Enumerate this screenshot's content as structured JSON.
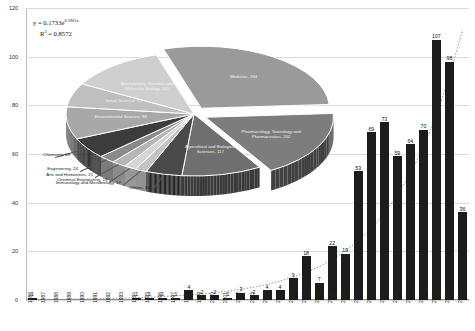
{
  "chart_data": {
    "type": "bar",
    "title": "",
    "xlabel": "",
    "ylabel": "",
    "ylim": [
      0,
      120
    ],
    "ytick_labels": [
      "0",
      "20",
      "40",
      "60",
      "80",
      "100",
      "120"
    ],
    "ytick_values": [
      0,
      20,
      40,
      60,
      80,
      100,
      120
    ],
    "grid": true,
    "legend": "none",
    "categories": [
      "1986",
      "1987",
      "1988",
      "1989",
      "1990",
      "1991",
      "1992",
      "1993",
      "1994",
      "1995",
      "1996",
      "1997",
      "1998",
      "1999",
      "2000",
      "2001",
      "2002",
      "2003",
      "2004",
      "2005",
      "2006",
      "2007",
      "2008",
      "2009",
      "2010",
      "2011",
      "2012",
      "2013",
      "2014",
      "2015",
      "2016",
      "2017",
      "2018",
      "2019"
    ],
    "values": [
      1,
      0,
      0,
      0,
      0,
      0,
      0,
      0,
      1,
      1,
      1,
      1,
      4,
      2,
      2,
      1,
      3,
      2,
      4,
      4,
      9,
      18,
      7,
      22,
      19,
      53,
      69,
      73,
      59,
      64,
      70,
      107,
      98,
      36
    ],
    "bar_labels": [
      "1",
      "",
      "",
      "",
      "",
      "",
      "",
      "",
      "1",
      "1",
      "1",
      "1",
      "4",
      "2",
      "2",
      "1",
      "3",
      "2",
      "4",
      "4",
      "9",
      "18",
      "7",
      "22",
      "19",
      "53",
      "69",
      "73",
      "59",
      "64",
      "70",
      "107",
      "98",
      "36"
    ],
    "bar_color": "#1c1c1c",
    "annotations": {
      "equation": "y = 0.1733e",
      "equation_exponent": "0.1901x",
      "r_squared_label": "R",
      "r_squared_sup": "2",
      "r_squared_value": " = 0.8572"
    },
    "trendline": {
      "type": "exponential",
      "equation": "y = 0.1733e^(0.1901x)",
      "r_squared": 0.8572,
      "style": "dotted"
    }
  },
  "pie_data": {
    "type": "pie",
    "style": "3d-exploded",
    "title": "",
    "slices": [
      {
        "label": "Medicine",
        "value": 334,
        "color": "#9a9a9a",
        "text": "Medicine, 334"
      },
      {
        "label": "Pharmacology, Toxicology and Pharmaceutics",
        "value": 202,
        "color": "#7d7d7d",
        "text": "Pharmacology, Toxicology and Pharmaceutics, 202"
      },
      {
        "label": "Agricultural and Biological Sciences",
        "value": 117,
        "color": "#6f6f6f",
        "text": "Agricultural and Biological Sciences, 117"
      },
      {
        "label": "Others",
        "value": 53,
        "color": "#4a4a4a",
        "text": "Others, 53"
      },
      {
        "label": "Immunology and Microbiology",
        "value": 17,
        "color": "#c4c4c4",
        "text": "Immunology and Microbiology, 17"
      },
      {
        "label": "Chemical Engineering",
        "value": 18,
        "color": "#d6d6d6",
        "text": "Chemical Engineering, 18"
      },
      {
        "label": "Arts and Humanities",
        "value": 21,
        "color": "#b5b5b5",
        "text": "Arts and Humanities, 21"
      },
      {
        "label": "Engineering",
        "value": 24,
        "color": "#8a8a8a",
        "text": "Engineering, 24"
      },
      {
        "label": "Chemistry",
        "value": 63,
        "color": "#3c3c3c",
        "text": "Chemistry, 63"
      },
      {
        "label": "Environmental Science",
        "value": 98,
        "color": "#a8a8a8",
        "text": "Environmental Science, 98"
      },
      {
        "label": "Social Science",
        "value": 72,
        "color": "#bfbfbf",
        "text": "Social Science, 72"
      },
      {
        "label": "Biochemistry, Genetics and Molecular Biology",
        "value": 141,
        "color": "#cfcfcf",
        "text": "Biochemistry, Genetics and Molecular Biology, 141"
      }
    ]
  }
}
